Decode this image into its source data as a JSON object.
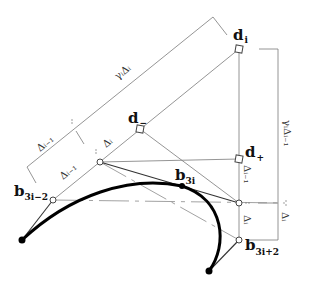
{
  "diagram": {
    "type": "bezier-construction",
    "points": {
      "d_i": {
        "label": "d",
        "sub": "i"
      },
      "d_minus": {
        "label": "d",
        "sub": "−"
      },
      "d_plus": {
        "label": "d",
        "sub": "+"
      },
      "b_3i_minus_2": {
        "label": "b",
        "sub": "3i−2"
      },
      "b_3i": {
        "label": "b",
        "sub": "3i"
      },
      "b_3i_plus_2": {
        "label": "b",
        "sub": "3i+2"
      }
    },
    "dimensions": {
      "gamma_delta_i": "γᵢΔᵢ",
      "delta_i_minus_1_upper": "Δᵢ₋₁",
      "delta_i_upper": "Δᵢ",
      "delta_i_minus_1_lower": "Δᵢ₋₁",
      "gamma_delta_i_minus_1": "γᵢΔᵢ₋₁",
      "delta_i_minus_1_vertical": "Δᵢ₋₁",
      "delta_i_vertical": "Δᵢ",
      "delta_i_right": "Δᵢ"
    },
    "colors": {
      "curve": "#000000",
      "construction": "#7a7a7a",
      "control_polygon": "#333333"
    }
  }
}
